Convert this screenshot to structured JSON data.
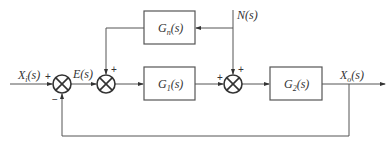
{
  "diagram": {
    "type": "control-system block diagram",
    "signals": {
      "input": {
        "main": "X",
        "sub": "i",
        "tail": "(s)"
      },
      "error": "E(s)",
      "disturbance": "N(s)",
      "output": {
        "main": "X",
        "sub": "o",
        "tail": "(s)"
      }
    },
    "blocks": {
      "gn": {
        "main": "G",
        "sub": "n",
        "tail": "(s)"
      },
      "g1": {
        "main": "G",
        "sub": "1",
        "tail": "(s)"
      },
      "g2": {
        "main": "G",
        "sub": "2",
        "tail": "(s)"
      }
    },
    "signs": {
      "sum1_input": "+",
      "sum1_feedback": "−",
      "sum2_gn": "+",
      "sum3_g1": "+",
      "sum3_n": "+"
    }
  }
}
